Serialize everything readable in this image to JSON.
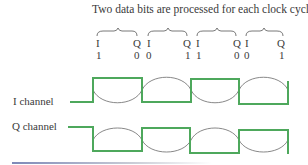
{
  "title": "Two data bits are processed for each clock cycle.",
  "groups": [
    {
      "i_label": "I",
      "q_label": "Q",
      "i_bit": "1",
      "q_bit": "0"
    },
    {
      "i_label": "I",
      "q_label": "Q",
      "i_bit": "0",
      "q_bit": "1"
    },
    {
      "i_label": "I",
      "q_label": "Q",
      "i_bit": "1",
      "q_bit": "0"
    },
    {
      "i_label": "I",
      "q_label": "Q",
      "i_bit": "0",
      "q_bit": "1"
    }
  ],
  "channels": {
    "i": {
      "label": "I channel",
      "bits": [
        1,
        0,
        1,
        0
      ]
    },
    "q": {
      "label": "Q channel",
      "bits": [
        0,
        1,
        0,
        1
      ]
    }
  },
  "colors": {
    "square_wave": "#4ea85c",
    "sine_wave": "#7a7a7a",
    "text": "#3a3a3a"
  }
}
